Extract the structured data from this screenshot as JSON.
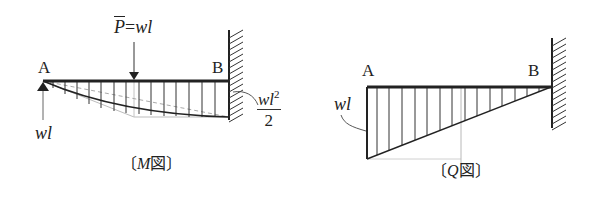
{
  "moment_diagram": {
    "label_a": "A",
    "label_b": "B",
    "load_label_symbol": "P",
    "load_label_eq": "=",
    "load_label_value": "wl",
    "reaction_label": "wl",
    "fixed_end_moment_num": "wl",
    "fixed_end_moment_exp": "2",
    "fixed_end_moment_den": "2",
    "caption_open": "〔",
    "caption_symbol": "M",
    "caption_text": "図",
    "caption_close": "〕"
  },
  "shear_diagram": {
    "label_a": "A",
    "label_b": "B",
    "shear_label": "wl",
    "caption_open": "〔",
    "caption_symbol": "Q",
    "caption_text": "図",
    "caption_close": "〕"
  },
  "colors": {
    "line": "#222222",
    "guide": "#b0b0b0",
    "dashed": "#a8a8a8"
  }
}
